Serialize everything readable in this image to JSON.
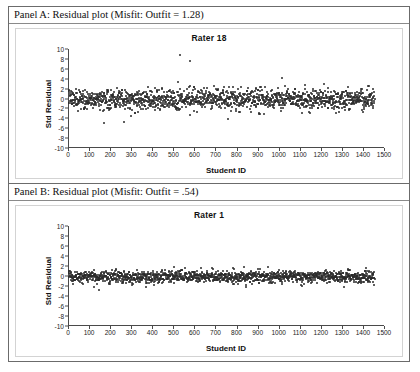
{
  "figure": {
    "panels": [
      {
        "id": "panel-a",
        "caption": "Panel A: Residual plot (Misfit: Outfit = 1.28)",
        "chart_data": {
          "type": "scatter",
          "title": "Rater 18",
          "xlabel": "Student ID",
          "ylabel": "Std Residual",
          "xlim": [
            0,
            1500
          ],
          "ylim": [
            -10,
            10
          ],
          "xticks": [
            0,
            100,
            200,
            300,
            400,
            500,
            600,
            700,
            800,
            900,
            1000,
            1100,
            1200,
            1300,
            1400,
            1500
          ],
          "yticks": [
            10,
            8,
            6,
            4,
            2,
            0,
            -2,
            -4,
            -6,
            -8,
            -10
          ],
          "grid": false,
          "legend": false,
          "marker_color": "#2b2b2b",
          "n_points": 1450,
          "band": {
            "mean": -0.1,
            "sd": 1.05,
            "x_start": 5,
            "x_end": 1455
          },
          "outliers": [
            {
              "x": 530,
              "y": 8.8
            },
            {
              "x": 578,
              "y": 7.6
            },
            {
              "x": 1018,
              "y": 4.1
            },
            {
              "x": 523,
              "y": 3.4
            },
            {
              "x": 172,
              "y": -4.9
            },
            {
              "x": 268,
              "y": -4.7
            },
            {
              "x": 300,
              "y": -3.6
            },
            {
              "x": 578,
              "y": -3.4
            },
            {
              "x": 760,
              "y": -4.1
            },
            {
              "x": 905,
              "y": -2.9
            },
            {
              "x": 1110,
              "y": -2.9
            }
          ]
        }
      },
      {
        "id": "panel-b",
        "caption": "Panel B: Residual plot (Misfit: Outfit = .54)",
        "chart_data": {
          "type": "scatter",
          "title": "Rater 1",
          "xlabel": "Student ID",
          "ylabel": "Std Residual",
          "xlim": [
            0,
            1500
          ],
          "ylim": [
            -10,
            10
          ],
          "xticks": [
            0,
            100,
            200,
            300,
            400,
            500,
            600,
            700,
            800,
            900,
            1000,
            1100,
            1200,
            1300,
            1400,
            1500
          ],
          "yticks": [
            10,
            8,
            6,
            4,
            2,
            0,
            -2,
            -4,
            -6,
            -8,
            -10
          ],
          "grid": false,
          "legend": false,
          "marker_color": "#2b2b2b",
          "n_points": 1450,
          "band": {
            "mean": -0.15,
            "sd": 0.62,
            "x_start": 5,
            "x_end": 1455
          },
          "outliers": [
            {
              "x": 148,
              "y": -2.7
            },
            {
              "x": 372,
              "y": -2.2
            },
            {
              "x": 845,
              "y": -2.1
            },
            {
              "x": 1415,
              "y": 1.6
            },
            {
              "x": 505,
              "y": 1.8
            }
          ]
        }
      }
    ]
  }
}
